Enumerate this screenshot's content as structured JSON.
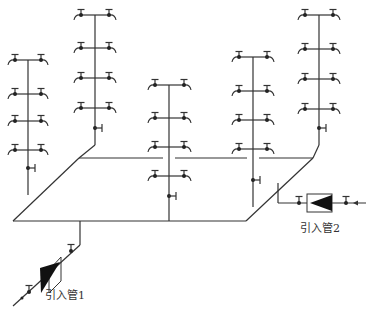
{
  "diagram": {
    "type": "water-supply-isometric-system",
    "line_color": "#333333",
    "background": "#ffffff",
    "risers": [
      {
        "id": "riser-1",
        "x": 28,
        "top": 60,
        "floors": [
          60,
          94,
          121,
          150
        ],
        "valve_y": 164,
        "bottom": 195
      },
      {
        "id": "riser-2",
        "x": 95,
        "top": 15,
        "floors": [
          15,
          48,
          78,
          108
        ],
        "valve_y": 127,
        "bottom": 148
      },
      {
        "id": "riser-3",
        "x": 170,
        "top": 85,
        "floors": [
          85,
          118,
          147,
          176
        ],
        "valve_y": 196,
        "bottom": 221
      },
      {
        "id": "riser-4",
        "x": 253,
        "top": 57,
        "floors": [
          57,
          91,
          120,
          149
        ],
        "valve_y": 180,
        "bottom": 207
      },
      {
        "id": "riser-5",
        "x": 319,
        "top": 15,
        "floors": [
          15,
          49,
          79,
          109
        ],
        "valve_y": 128,
        "bottom": 148
      }
    ],
    "fixture": {
      "name": "faucet",
      "half_width": 13
    },
    "inlets": [
      {
        "id": "inlet-1",
        "label": "引入管1"
      },
      {
        "id": "inlet-2",
        "label": "引入管2"
      }
    ]
  }
}
